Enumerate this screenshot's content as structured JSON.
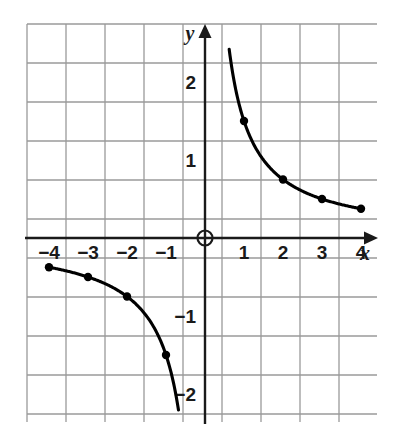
{
  "figure": {
    "background_color": "#ffffff",
    "grid_color": "#9a9a9a",
    "axis_color": "#1a1a1a",
    "curve_color": "#000000",
    "point_color": "#000000"
  },
  "axes": {
    "x_axis_label": "x",
    "y_axis_label": "y",
    "origin_marker": "circle",
    "x_tick_labels": [
      "-4",
      "-3",
      "-2",
      "-1",
      "1",
      "2",
      "3",
      "4"
    ],
    "y_tick_labels": [
      "2",
      "1",
      "-1",
      "-2"
    ]
  },
  "chart_data": {
    "type": "line",
    "title": "",
    "xlabel": "x",
    "ylabel": "y",
    "xlim": [
      -4.5,
      4.5
    ],
    "ylim": [
      -2.5,
      2.5
    ],
    "grid": true,
    "grid_spacing_x": 1,
    "grid_spacing_y": 0.5,
    "legend": "none",
    "equation": "y = 1.5 / x",
    "series": [
      {
        "name": "branch-positive",
        "x": [
          1,
          2,
          3,
          4
        ],
        "values": [
          1.5,
          0.75,
          0.5,
          0.375
        ],
        "curve_start": {
          "x": 0.62,
          "y": 2.42
        },
        "curve_end": {
          "x": 4,
          "y": 0.375
        }
      },
      {
        "name": "branch-negative",
        "x": [
          -4,
          -3,
          -2,
          -1
        ],
        "values": [
          -0.375,
          -0.5,
          -0.75,
          -1.5
        ],
        "curve_start": {
          "x": -4,
          "y": -0.375
        },
        "curve_end": {
          "x": -0.68,
          "y": -2.2
        }
      }
    ]
  }
}
